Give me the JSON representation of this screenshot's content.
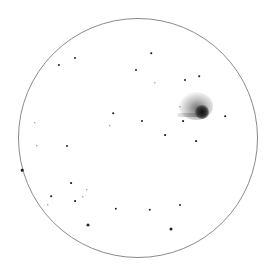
{
  "sketch": {
    "type": "eyepiece-field-drawing",
    "field_circle": {
      "cx": 138,
      "cy": 138,
      "r": 120,
      "color": "#8a8a8a"
    },
    "object": {
      "kind": "nebulous-object",
      "core": {
        "x": 202,
        "y": 112,
        "size": 14,
        "color": "#1a1a1a"
      },
      "halo": {
        "x": 196,
        "y": 106,
        "w": 34,
        "h": 28,
        "color": "#9a9a9a"
      },
      "streak": {
        "x1": 177,
        "y1": 115,
        "x2": 200,
        "y2": 113
      }
    },
    "stars": [
      {
        "x": 59,
        "y": 65,
        "s": 2.2
      },
      {
        "x": 75,
        "y": 58,
        "s": 2
      },
      {
        "x": 151,
        "y": 53,
        "s": 1.5
      },
      {
        "x": 136,
        "y": 70,
        "s": 2
      },
      {
        "x": 155,
        "y": 83,
        "s": 1.3
      },
      {
        "x": 185,
        "y": 80,
        "s": 2
      },
      {
        "x": 199,
        "y": 76,
        "s": 1.6
      },
      {
        "x": 180,
        "y": 107,
        "s": 1.3
      },
      {
        "x": 183,
        "y": 121,
        "s": 1.8
      },
      {
        "x": 225,
        "y": 116,
        "s": 1.6
      },
      {
        "x": 113,
        "y": 113,
        "s": 1.6
      },
      {
        "x": 110,
        "y": 126,
        "s": 1.4
      },
      {
        "x": 142,
        "y": 121,
        "s": 2
      },
      {
        "x": 165,
        "y": 135,
        "s": 1.8
      },
      {
        "x": 196,
        "y": 141,
        "s": 1.8
      },
      {
        "x": 35,
        "y": 123,
        "s": 1.4
      },
      {
        "x": 37,
        "y": 146,
        "s": 1.4
      },
      {
        "x": 67,
        "y": 146,
        "s": 2
      },
      {
        "x": 22,
        "y": 170,
        "s": 2.6
      },
      {
        "x": 71,
        "y": 183,
        "s": 1.8
      },
      {
        "x": 87,
        "y": 190,
        "s": 1.4
      },
      {
        "x": 51,
        "y": 196,
        "s": 1.6
      },
      {
        "x": 48,
        "y": 205,
        "s": 1.4
      },
      {
        "x": 75,
        "y": 201,
        "s": 1.8
      },
      {
        "x": 83,
        "y": 197,
        "s": 1.4
      },
      {
        "x": 116,
        "y": 209,
        "s": 2.4
      },
      {
        "x": 150,
        "y": 210,
        "s": 2.4
      },
      {
        "x": 180,
        "y": 205,
        "s": 2
      },
      {
        "x": 88,
        "y": 225,
        "s": 3
      },
      {
        "x": 171,
        "y": 229,
        "s": 3
      }
    ]
  }
}
